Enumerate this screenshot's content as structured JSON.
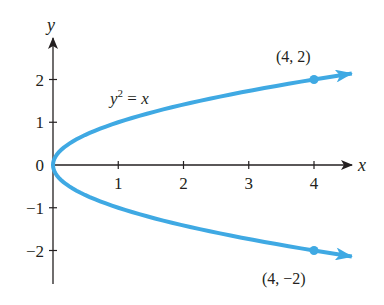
{
  "chart_data": {
    "type": "line",
    "title": "",
    "equation": "y² = x",
    "equation_parts": {
      "base": "y",
      "exp": "2",
      "rest": " = x"
    },
    "xlabel": "x",
    "ylabel": "y",
    "x_ticks": [
      1,
      2,
      3,
      4
    ],
    "y_ticks": [
      2,
      1,
      0,
      -1,
      -2
    ],
    "x_tick_labels": [
      "1",
      "2",
      "3",
      "4"
    ],
    "y_tick_labels": [
      "2",
      "1",
      "0",
      "−1",
      "−2"
    ],
    "xlim": [
      0,
      4.6
    ],
    "ylim": [
      -2.7,
      2.9
    ],
    "grid": false,
    "series": [
      {
        "name": "y^2 = x",
        "color": "#3fa9e3",
        "x": [
          4.0,
          2.25,
          1.0,
          0.25,
          0.0,
          0.25,
          1.0,
          2.25,
          4.0
        ],
        "y": [
          -2.0,
          -1.5,
          -1.0,
          -0.5,
          0.0,
          0.5,
          1.0,
          1.5,
          2.0
        ],
        "arrows_at_ends": true
      }
    ],
    "points": [
      {
        "x": 4,
        "y": 2,
        "label": "(4, 2)"
      },
      {
        "x": 4,
        "y": -2,
        "label": "(4, −2)"
      }
    ],
    "axis_color": "#231f20"
  }
}
